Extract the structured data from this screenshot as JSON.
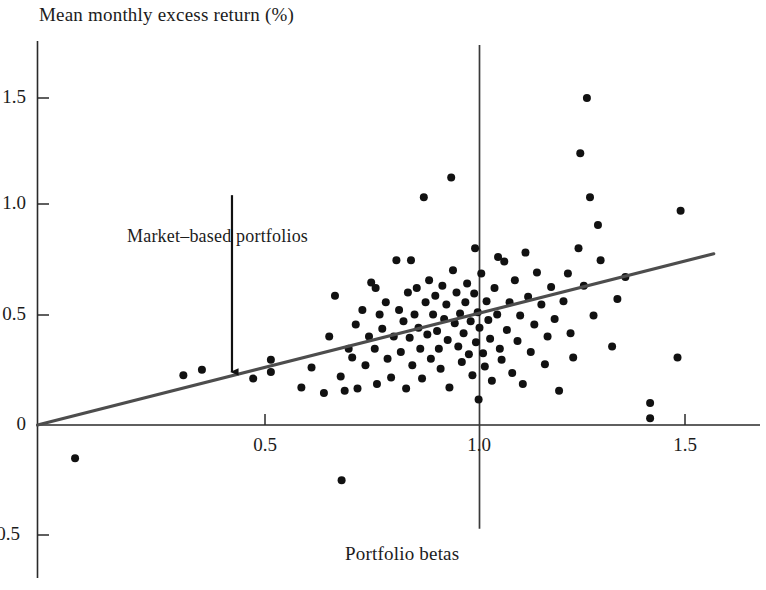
{
  "chart_data": {
    "type": "scatter",
    "title": "",
    "xlabel": "Portfolio betas",
    "ylabel": "Mean monthly excess return (%)",
    "xlim": [
      -0.05,
      1.62
    ],
    "ylim": [
      -0.72,
      1.72
    ],
    "xticks": [
      0.5,
      1.0,
      1.5
    ],
    "xtick_labels": [
      "0.5",
      "1.0",
      "1.5"
    ],
    "yticks": [
      -0.5,
      0,
      0.5,
      1.0,
      1.5
    ],
    "ytick_labels": [
      "-0.5",
      "0",
      "0.5",
      "1.0",
      "1.5"
    ],
    "grid": false,
    "legend": null,
    "annotations": [
      {
        "text": "Market–based portfolios",
        "x": 0.42,
        "y": 1.12,
        "arrow_from_y": 1.04,
        "arrow_to_x": 0.44,
        "arrow_to_y": 0.24
      }
    ],
    "reference_lines": [
      {
        "name": "beta-one-vertical",
        "orientation": "vertical",
        "x": 1.0,
        "y_from": -0.47,
        "y_to": 1.72
      }
    ],
    "fit_line": {
      "name": "security-market-line",
      "x_from": 0.0,
      "y_from": 0.0,
      "x_to": 1.53,
      "y_to": 0.775,
      "slope": 0.506,
      "intercept": 0.0,
      "color": "#4d4d4d"
    },
    "marker_color": "#111111",
    "marker_radius": 4.0,
    "points": [
      [
        0.085,
        -0.15
      ],
      [
        0.33,
        0.225
      ],
      [
        0.372,
        0.25
      ],
      [
        0.488,
        0.21
      ],
      [
        0.528,
        0.295
      ],
      [
        0.528,
        0.24
      ],
      [
        0.597,
        0.17
      ],
      [
        0.688,
        -0.25
      ],
      [
        0.62,
        0.26
      ],
      [
        0.648,
        0.145
      ],
      [
        0.66,
        0.4
      ],
      [
        0.673,
        0.585
      ],
      [
        0.686,
        0.22
      ],
      [
        0.695,
        0.155
      ],
      [
        0.704,
        0.345
      ],
      [
        0.712,
        0.305
      ],
      [
        0.72,
        0.455
      ],
      [
        0.724,
        0.165
      ],
      [
        0.735,
        0.52
      ],
      [
        0.742,
        0.27
      ],
      [
        0.75,
        0.4
      ],
      [
        0.755,
        0.645
      ],
      [
        0.763,
        0.345
      ],
      [
        0.768,
        0.185
      ],
      [
        0.774,
        0.5
      ],
      [
        0.78,
        0.435
      ],
      [
        0.788,
        0.555
      ],
      [
        0.792,
        0.3
      ],
      [
        0.8,
        0.215
      ],
      [
        0.806,
        0.4
      ],
      [
        0.812,
        0.745
      ],
      [
        0.818,
        0.52
      ],
      [
        0.822,
        0.33
      ],
      [
        0.828,
        0.47
      ],
      [
        0.834,
        0.165
      ],
      [
        0.838,
        0.6
      ],
      [
        0.842,
        0.395
      ],
      [
        0.848,
        0.27
      ],
      [
        0.853,
        0.5
      ],
      [
        0.858,
        0.62
      ],
      [
        0.862,
        0.44
      ],
      [
        0.866,
        0.345
      ],
      [
        0.87,
        0.21
      ],
      [
        0.874,
        1.03
      ],
      [
        0.878,
        0.555
      ],
      [
        0.882,
        0.41
      ],
      [
        0.886,
        0.655
      ],
      [
        0.89,
        0.3
      ],
      [
        0.895,
        0.5
      ],
      [
        0.9,
        0.585
      ],
      [
        0.904,
        0.425
      ],
      [
        0.908,
        0.345
      ],
      [
        0.912,
        0.255
      ],
      [
        0.916,
        0.63
      ],
      [
        0.92,
        0.48
      ],
      [
        0.925,
        0.545
      ],
      [
        0.928,
        0.385
      ],
      [
        0.932,
        0.17
      ],
      [
        0.936,
        1.12
      ],
      [
        0.94,
        0.7
      ],
      [
        0.944,
        0.46
      ],
      [
        0.948,
        0.6
      ],
      [
        0.952,
        0.355
      ],
      [
        0.956,
        0.505
      ],
      [
        0.96,
        0.285
      ],
      [
        0.964,
        0.415
      ],
      [
        0.968,
        0.555
      ],
      [
        0.972,
        0.64
      ],
      [
        0.976,
        0.32
      ],
      [
        0.98,
        0.47
      ],
      [
        0.984,
        0.225
      ],
      [
        0.988,
        0.595
      ],
      [
        0.992,
        0.375
      ],
      [
        0.996,
        0.51
      ],
      [
        0.998,
        0.115
      ],
      [
        1.0,
        0.44
      ],
      [
        1.004,
        0.685
      ],
      [
        1.008,
        0.325
      ],
      [
        1.012,
        0.265
      ],
      [
        1.016,
        0.56
      ],
      [
        1.02,
        0.475
      ],
      [
        1.024,
        0.39
      ],
      [
        1.028,
        0.2
      ],
      [
        1.034,
        0.62
      ],
      [
        1.04,
        0.5
      ],
      [
        1.046,
        0.345
      ],
      [
        1.05,
        0.295
      ],
      [
        1.056,
        0.74
      ],
      [
        1.062,
        0.43
      ],
      [
        1.068,
        0.555
      ],
      [
        1.074,
        0.235
      ],
      [
        1.08,
        0.655
      ],
      [
        1.086,
        0.38
      ],
      [
        1.092,
        0.495
      ],
      [
        1.098,
        0.185
      ],
      [
        1.104,
        0.78
      ],
      [
        1.11,
        0.58
      ],
      [
        1.116,
        0.33
      ],
      [
        1.124,
        0.455
      ],
      [
        1.13,
        0.69
      ],
      [
        1.14,
        0.545
      ],
      [
        1.148,
        0.275
      ],
      [
        1.154,
        0.4
      ],
      [
        1.162,
        0.625
      ],
      [
        1.17,
        0.48
      ],
      [
        1.18,
        0.155
      ],
      [
        1.19,
        0.56
      ],
      [
        1.2,
        0.685
      ],
      [
        1.206,
        0.415
      ],
      [
        1.212,
        0.305
      ],
      [
        1.224,
        0.8
      ],
      [
        1.228,
        1.23
      ],
      [
        1.236,
        0.63
      ],
      [
        1.243,
        1.48
      ],
      [
        1.25,
        1.03
      ],
      [
        1.258,
        0.495
      ],
      [
        1.268,
        0.905
      ],
      [
        1.274,
        0.745
      ],
      [
        1.3,
        0.355
      ],
      [
        1.312,
        0.57
      ],
      [
        1.33,
        0.67
      ],
      [
        1.386,
        0.1
      ],
      [
        1.386,
        0.03
      ],
      [
        1.448,
        0.305
      ],
      [
        1.455,
        0.97
      ],
      [
        0.765,
        0.62
      ],
      [
        0.845,
        0.745
      ],
      [
        0.99,
        0.8
      ],
      [
        1.042,
        0.76
      ]
    ]
  }
}
